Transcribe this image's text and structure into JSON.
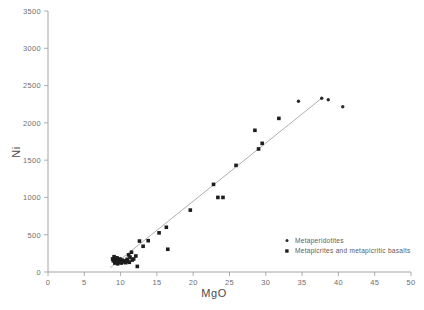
{
  "figure": {
    "background_color": "#ffffff",
    "axis_color": "#9a9a9a",
    "marker_color": "#1d1d1d",
    "trend_color": "#9b9b9b"
  },
  "axes": {
    "x": {
      "label": "MgO",
      "min": 0,
      "max": 50,
      "ticks": [
        0,
        5,
        10,
        15,
        20,
        25,
        30,
        35,
        40,
        45,
        50
      ],
      "tick_labels": [
        "0",
        "5",
        "10",
        "15",
        "20",
        "25",
        "30",
        "35",
        "40",
        "45",
        "50"
      ]
    },
    "y": {
      "label": "Ni",
      "min": 0,
      "max": 3500,
      "ticks": [
        0,
        500,
        1000,
        1500,
        2000,
        2500,
        3000,
        3500
      ],
      "tick_labels": [
        "0",
        "500",
        "1000",
        "1500",
        "2000",
        "2500",
        "3000",
        "3500"
      ]
    }
  },
  "legend": {
    "position": "bottom-right",
    "items": [
      {
        "label": "Metaperidotites",
        "marker": "dot"
      },
      {
        "label": "Metapicrites and metapicritic basalts",
        "marker": "square"
      }
    ]
  },
  "chart_data": {
    "type": "scatter",
    "title": "",
    "xlabel": "MgO",
    "ylabel": "Ni",
    "xlim": [
      0,
      50
    ],
    "ylim": [
      0,
      3500
    ],
    "grid": false,
    "legend_position": "bottom-right",
    "series": [
      {
        "name": "Metaperidotites",
        "marker": "dot",
        "color": "#2a2a2a",
        "points": [
          [
            34.5,
            2290
          ],
          [
            37.7,
            2330
          ],
          [
            38.6,
            2310
          ],
          [
            40.6,
            2215
          ]
        ]
      },
      {
        "name": "Metapicrites and metapicritic basalts",
        "marker": "square",
        "color": "#1d1d1d",
        "points": [
          [
            8.9,
            175
          ],
          [
            9.0,
            150
          ],
          [
            9.1,
            205
          ],
          [
            9.2,
            120
          ],
          [
            9.3,
            165
          ],
          [
            9.4,
            140
          ],
          [
            9.5,
            190
          ],
          [
            9.6,
            110
          ],
          [
            9.7,
            155
          ],
          [
            9.8,
            130
          ],
          [
            9.9,
            175
          ],
          [
            10.0,
            145
          ],
          [
            10.1,
            120
          ],
          [
            10.2,
            160
          ],
          [
            10.4,
            135
          ],
          [
            10.5,
            150
          ],
          [
            10.7,
            125
          ],
          [
            10.9,
            170
          ],
          [
            11.0,
            145
          ],
          [
            11.1,
            230
          ],
          [
            11.2,
            130
          ],
          [
            11.3,
            200
          ],
          [
            11.5,
            265
          ],
          [
            11.6,
            160
          ],
          [
            11.8,
            175
          ],
          [
            12.1,
            215
          ],
          [
            12.3,
            75
          ],
          [
            12.6,
            415
          ],
          [
            13.1,
            345
          ],
          [
            13.8,
            420
          ],
          [
            15.3,
            525
          ],
          [
            16.3,
            600
          ],
          [
            16.5,
            305
          ],
          [
            19.6,
            830
          ],
          [
            22.8,
            1175
          ],
          [
            23.4,
            1000
          ],
          [
            24.1,
            1000
          ],
          [
            25.9,
            1430
          ],
          [
            28.5,
            1900
          ],
          [
            29.0,
            1650
          ],
          [
            29.5,
            1725
          ],
          [
            31.8,
            2060
          ]
        ]
      }
    ],
    "trend_line": {
      "x_start": 8.6,
      "y_start": 60,
      "x_end": 37.7,
      "y_end": 2330
    }
  }
}
